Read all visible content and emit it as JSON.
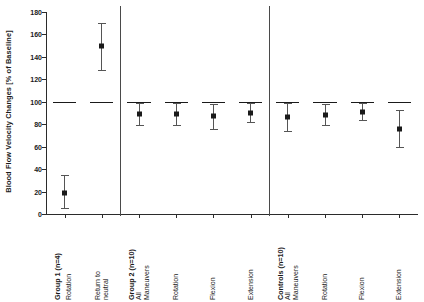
{
  "chart_data": {
    "type": "scatter",
    "title": "",
    "xlabel": "",
    "ylabel": "Blood Flow Velocity Changes [% of Baseline]",
    "ylim": [
      0,
      180
    ],
    "yticks": [
      0,
      20,
      40,
      60,
      80,
      100,
      120,
      140,
      160,
      180
    ],
    "ytick_labels": [
      "0",
      "20",
      "40",
      "60",
      "80",
      "100",
      "120",
      "140",
      "160",
      "180"
    ],
    "grid": false,
    "legend": "none",
    "reference_line": 100,
    "reference_line_label": "100% of Baseline",
    "groups": [
      {
        "name": "Group 1 (n=4)",
        "points": [
          {
            "label": "Rotation",
            "value": 19,
            "low": 5,
            "high": 35
          },
          {
            "label": "Return to neutral",
            "value": 150,
            "low": 128,
            "high": 170
          }
        ]
      },
      {
        "name": "Group 2 (n=10)",
        "points": [
          {
            "label": "All Maneuvers",
            "value": 89,
            "low": 79,
            "high": 99
          },
          {
            "label": "Rotation",
            "value": 89,
            "low": 79,
            "high": 99
          },
          {
            "label": "Flexion",
            "value": 87,
            "low": 76,
            "high": 98
          },
          {
            "label": "Extension",
            "value": 90,
            "low": 82,
            "high": 99
          }
        ]
      },
      {
        "name": "Controls (n=10)",
        "points": [
          {
            "label": "All Maneuvers",
            "value": 86,
            "low": 74,
            "high": 99
          },
          {
            "label": "Rotation",
            "value": 88,
            "low": 79,
            "high": 98
          },
          {
            "label": "Flexion",
            "value": 91,
            "low": 84,
            "high": 99
          },
          {
            "label": "Extension",
            "value": 76,
            "low": 60,
            "high": 93
          }
        ]
      }
    ],
    "categories": [
      "Group 1 (n=4)\nRotation",
      "Return to neutral",
      "Group 2 (n=10)\nAll Maneuvers",
      "Rotation",
      "Flexion",
      "Extension",
      "Controls (n=10)\nAll Maneuvers",
      "Rotation",
      "Flexion",
      "Extension"
    ],
    "values": [
      19,
      150,
      89,
      89,
      87,
      90,
      86,
      88,
      91,
      76
    ],
    "error_low": [
      5,
      128,
      79,
      79,
      76,
      82,
      74,
      79,
      84,
      60
    ],
    "error_high": [
      35,
      170,
      99,
      99,
      98,
      99,
      99,
      98,
      99,
      93
    ]
  },
  "axis": {
    "y_title": "Blood Flow Velocity Changes [% of Baseline]"
  },
  "colors": {
    "axis": "#2b2b2b",
    "marker": "#1a1a1a",
    "whisker": "#555555",
    "separator": "#4a4a4a",
    "baseline": "#1a1a1a",
    "background": "#ffffff"
  },
  "x_labels": [
    {
      "primary": "Group 1 (n=4)",
      "secondary": "Rotation",
      "bold": true
    },
    {
      "primary": "",
      "secondary": "Return to\nneutral",
      "bold": false
    },
    {
      "primary": "Group 2 (n=10)",
      "secondary": "All\nManeuvers",
      "bold": true
    },
    {
      "primary": "",
      "secondary": "Rotation",
      "bold": false
    },
    {
      "primary": "",
      "secondary": "Flexion",
      "bold": false
    },
    {
      "primary": "",
      "secondary": "Extension",
      "bold": false
    },
    {
      "primary": "Controls (n=10)",
      "secondary": "All\nManeuvers",
      "bold": true
    },
    {
      "primary": "",
      "secondary": "Rotation",
      "bold": false
    },
    {
      "primary": "",
      "secondary": "Flexion",
      "bold": false
    },
    {
      "primary": "",
      "secondary": "Extension",
      "bold": false
    }
  ]
}
